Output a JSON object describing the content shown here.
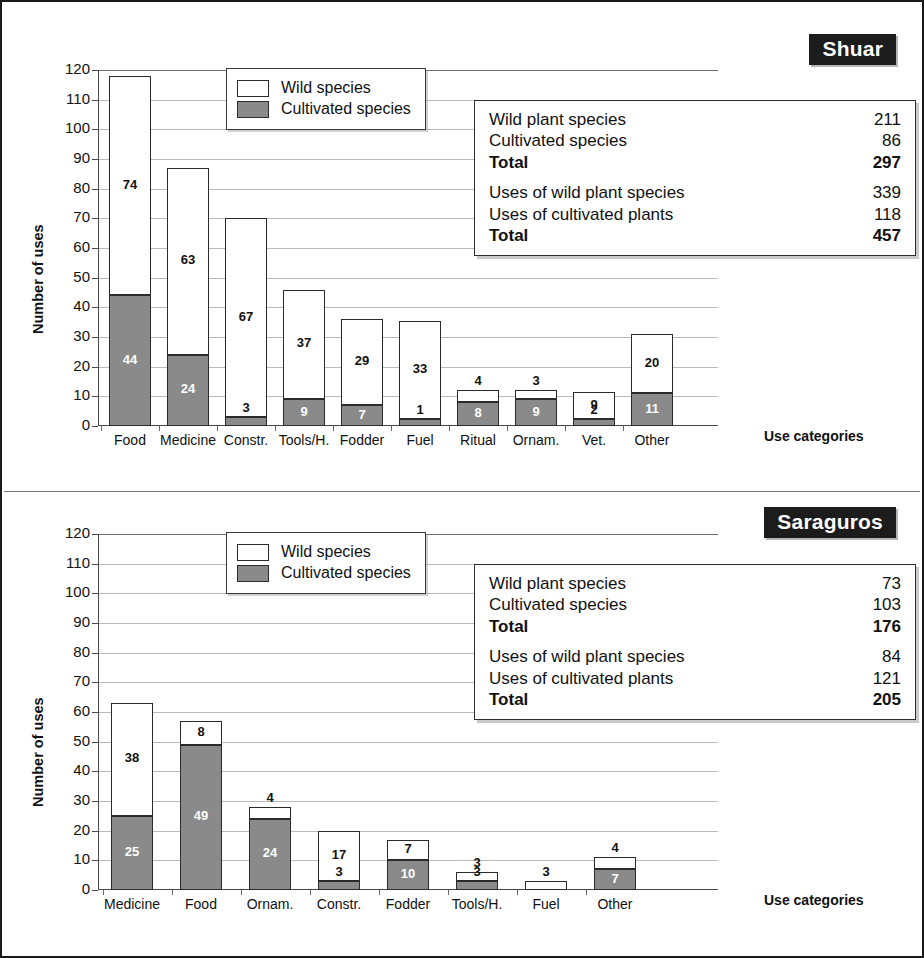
{
  "figure": {
    "background": "#ffffff",
    "frame_color": "#1a1a1a",
    "wild_color": "#ffffff",
    "cultivated_color": "#8a8a8a"
  },
  "legend": {
    "wild_label": "Wild species",
    "cultivated_label": "Cultivated species"
  },
  "panels": [
    {
      "id": "shuar",
      "title": "Shuar",
      "ylabel": "Number of uses",
      "xlabel": "Use categories",
      "yticks": [
        "0",
        "10",
        "20",
        "30",
        "40",
        "50",
        "60",
        "70",
        "80",
        "90",
        "100",
        "110",
        "120"
      ],
      "stats": [
        [
          {
            "label": "Wild plant species",
            "value": "211",
            "bold": false
          },
          {
            "label": "Cultivated species",
            "value": "86",
            "bold": false
          },
          {
            "label": "Total",
            "value": "297",
            "bold": true
          }
        ],
        [
          {
            "label": "Uses of wild plant species",
            "value": "339",
            "bold": false
          },
          {
            "label": "Uses of cultivated plants",
            "value": "118",
            "bold": false
          },
          {
            "label": "Total",
            "value": "457",
            "bold": true
          }
        ]
      ]
    },
    {
      "id": "saraguros",
      "title": "Saraguros",
      "ylabel": "Number of uses",
      "xlabel": "Use categories",
      "yticks": [
        "0",
        "10",
        "20",
        "30",
        "40",
        "50",
        "60",
        "70",
        "80",
        "90",
        "100",
        "110",
        "120"
      ],
      "stats": [
        [
          {
            "label": "Wild plant species",
            "value": "73",
            "bold": false
          },
          {
            "label": "Cultivated species",
            "value": "103",
            "bold": false
          },
          {
            "label": "Total",
            "value": "176",
            "bold": true
          }
        ],
        [
          {
            "label": "Uses of wild plant species",
            "value": "84",
            "bold": false
          },
          {
            "label": "Uses of cultivated plants",
            "value": "121",
            "bold": false
          },
          {
            "label": "Total",
            "value": "205",
            "bold": true
          }
        ]
      ]
    }
  ],
  "chart_data": [
    {
      "type": "bar",
      "stacked": true,
      "title": "Shuar",
      "xlabel": "Use categories",
      "ylabel": "Number of uses",
      "ylim": [
        0,
        120
      ],
      "ytick_step": 10,
      "grid": true,
      "legend_position": "upper-left-inside",
      "categories": [
        "Food",
        "Medicine",
        "Constr.",
        "Tools/H.",
        "Fodder",
        "Fuel",
        "Ritual",
        "Ornam.",
        "Vet.",
        "Other"
      ],
      "series": [
        {
          "name": "Cultivated species",
          "values": [
            44,
            24,
            3,
            9,
            7,
            1,
            8,
            9,
            2,
            11
          ]
        },
        {
          "name": "Wild species",
          "values": [
            74,
            63,
            67,
            37,
            29,
            33,
            4,
            3,
            9,
            20
          ]
        }
      ],
      "totals": [
        118,
        87,
        70,
        46,
        36,
        34,
        12,
        12,
        11,
        31
      ]
    },
    {
      "type": "bar",
      "stacked": true,
      "title": "Saraguros",
      "xlabel": "Use categories",
      "ylabel": "Number of uses",
      "ylim": [
        0,
        120
      ],
      "ytick_step": 10,
      "grid": true,
      "legend_position": "upper-left-inside",
      "categories": [
        "Medicine",
        "Food",
        "Ornam.",
        "Constr.",
        "Fodder",
        "Tools/H.",
        "Fuel",
        "Other"
      ],
      "series": [
        {
          "name": "Cultivated species",
          "values": [
            25,
            49,
            24,
            3,
            10,
            3,
            0,
            7
          ]
        },
        {
          "name": "Wild species",
          "values": [
            38,
            8,
            4,
            17,
            7,
            3,
            3,
            4
          ]
        }
      ],
      "totals": [
        63,
        57,
        28,
        20,
        17,
        6,
        3,
        11
      ]
    }
  ]
}
